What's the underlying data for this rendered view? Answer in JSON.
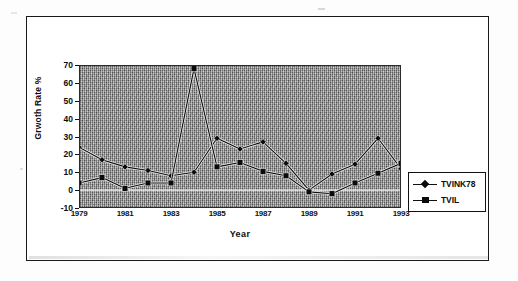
{
  "chart_data": {
    "type": "line",
    "title": "",
    "xlabel": "Year",
    "ylabel": "Grwoth Rate %",
    "xlim": [
      1979,
      1993
    ],
    "ylim": [
      -10,
      70
    ],
    "ytick_labels": [
      "70",
      "60",
      "50",
      "40",
      "30",
      "20",
      "10",
      "0",
      "-10"
    ],
    "ytick_values": [
      70,
      60,
      50,
      40,
      30,
      20,
      10,
      0,
      -10
    ],
    "xtick_labels": [
      "1979",
      "1981",
      "1983",
      "1985",
      "1987",
      "1989",
      "1991",
      "1993"
    ],
    "xtick_values": [
      1979,
      1981,
      1983,
      1985,
      1987,
      1989,
      1991,
      1993
    ],
    "x": [
      1979,
      1980,
      1981,
      1982,
      1983,
      1984,
      1985,
      1986,
      1987,
      1988,
      1989,
      1990,
      1991,
      1992,
      1993
    ],
    "grid": false,
    "legend_position": "right",
    "plot_background": "#8f8f8f",
    "series": [
      {
        "name": "TVINK78",
        "marker": "diamond",
        "color": "#0b0b0b",
        "values": [
          24,
          17,
          13,
          11,
          8,
          10,
          29,
          23,
          27,
          15,
          0,
          9,
          14.5,
          29,
          12
        ]
      },
      {
        "name": "TVIL",
        "marker": "square",
        "color": "#0b0b0b",
        "values": [
          4,
          7,
          1,
          4,
          4,
          68,
          13,
          15.5,
          10.5,
          8,
          -1,
          -2,
          4,
          9.5,
          15
        ]
      }
    ]
  },
  "legend": {
    "entries": [
      {
        "label": "TVINK78",
        "marker": "diamond-marker-icon"
      },
      {
        "label": "TVIL",
        "marker": "square-marker-icon"
      }
    ]
  },
  "axes": {
    "y_title": "Grwoth Rate %",
    "x_title": "Year"
  }
}
